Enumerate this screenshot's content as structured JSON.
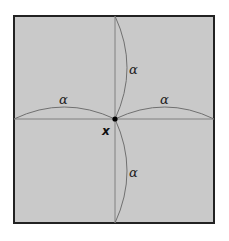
{
  "diagram": {
    "labels": {
      "arc_top": "α",
      "arc_left": "α",
      "arc_right": "α",
      "arc_bottom": "α",
      "point": "x"
    },
    "colors": {
      "fill": "#c8c8c8",
      "border": "#222222",
      "lines": "#777777",
      "point": "#000000"
    }
  }
}
